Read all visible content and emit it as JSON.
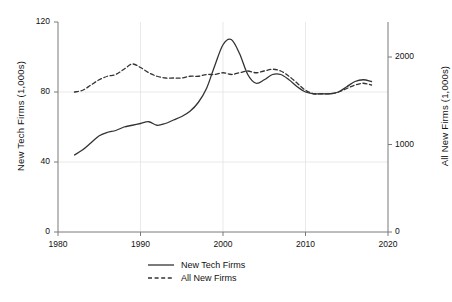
{
  "chart_data": {
    "type": "line",
    "title": "",
    "xlabel": "",
    "ylabel": "New Tech Firms (1,000s)",
    "y2label": "All New Firms (1,000s)",
    "xlim": [
      1980,
      2020
    ],
    "ylim": [
      0,
      120
    ],
    "y2lim": [
      0,
      2400
    ],
    "xticks": [
      1980,
      1990,
      2000,
      2010,
      2020
    ],
    "xticklabels": [
      "1980",
      "1990",
      "2000",
      "2010",
      "2020"
    ],
    "yticks": [
      0,
      40,
      80,
      120
    ],
    "yticklabels": [
      "0",
      "40",
      "80",
      "120"
    ],
    "y2ticks": [
      0,
      1000,
      2000
    ],
    "y2ticklabels": [
      "0",
      "1000",
      "2000"
    ],
    "grid": true,
    "legend_position": "below-center",
    "series": [
      {
        "name": "New Tech Firms",
        "axis": "left",
        "linestyle": "solid",
        "color": "#333333",
        "x": [
          1982,
          1983,
          1984,
          1985,
          1986,
          1987,
          1988,
          1989,
          1990,
          1991,
          1992,
          1993,
          1994,
          1995,
          1996,
          1997,
          1998,
          1999,
          2000,
          2001,
          2002,
          2003,
          2004,
          2005,
          2006,
          2007,
          2008,
          2009,
          2010,
          2011,
          2012,
          2013,
          2014,
          2015,
          2016,
          2017,
          2018
        ],
        "values": [
          44,
          47,
          51,
          55,
          57,
          58,
          60,
          61,
          62,
          63,
          61,
          62,
          64,
          66,
          69,
          74,
          82,
          95,
          107,
          110,
          102,
          90,
          85,
          87,
          90,
          90,
          87,
          83,
          80,
          79,
          79,
          79,
          80,
          83,
          86,
          87,
          86
        ]
      },
      {
        "name": "All New Firms",
        "axis": "right",
        "linestyle": "dashed",
        "color": "#333333",
        "x": [
          1982,
          1983,
          1984,
          1985,
          1986,
          1987,
          1988,
          1989,
          1990,
          1991,
          1992,
          1993,
          1994,
          1995,
          1996,
          1997,
          1998,
          1999,
          2000,
          2001,
          2002,
          2003,
          2004,
          2005,
          2006,
          2007,
          2008,
          2009,
          2010,
          2011,
          2012,
          2013,
          2014,
          2015,
          2016,
          2017,
          2018
        ],
        "values_left_scale": [
          80,
          81,
          84,
          87,
          89,
          90,
          93,
          96,
          94,
          91,
          89,
          88,
          88,
          88,
          89,
          89,
          90,
          90,
          91,
          90,
          91,
          92,
          91,
          92,
          93,
          92,
          89,
          85,
          81,
          79,
          79,
          79,
          80,
          82,
          84,
          85,
          84
        ],
        "values": [
          1600,
          1620,
          1680,
          1740,
          1780,
          1800,
          1860,
          1920,
          1880,
          1820,
          1780,
          1760,
          1760,
          1760,
          1780,
          1780,
          1800,
          1800,
          1820,
          1800,
          1820,
          1840,
          1820,
          1840,
          1860,
          1840,
          1780,
          1700,
          1620,
          1580,
          1580,
          1580,
          1600,
          1640,
          1680,
          1700,
          1680
        ]
      }
    ],
    "legend": [
      {
        "label": "New Tech Firms",
        "linestyle": "solid"
      },
      {
        "label": "All New Firms",
        "linestyle": "dashed"
      }
    ]
  }
}
